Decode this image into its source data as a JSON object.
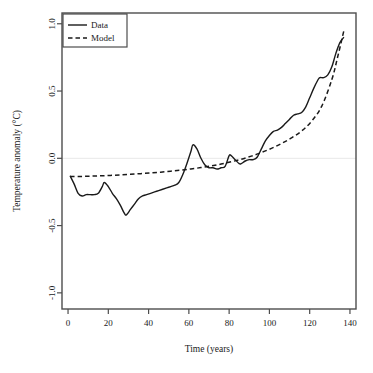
{
  "chart_data": {
    "type": "line",
    "title": "",
    "xlabel": "Time (years)",
    "ylabel": "Temperature anomaly (°C)",
    "xlim": [
      -3,
      143
    ],
    "ylim": [
      -1.12,
      1.08
    ],
    "xticks": [
      0,
      20,
      40,
      60,
      80,
      100,
      120,
      140
    ],
    "xticklabels": [
      "0",
      "20",
      "40",
      "60",
      "80",
      "100",
      "120",
      "140"
    ],
    "yticks": [
      -1.0,
      -0.5,
      0.0,
      0.5,
      1.0
    ],
    "yticklabels": [
      "-1.0",
      "-0.5",
      "0.0",
      "0.5",
      "1.0"
    ],
    "grid": false,
    "zero_line": true,
    "zero_line_color": "#e8e8e8",
    "frame": true,
    "frame_color": "#4d4d4d",
    "legend": {
      "position": "top-left",
      "entries": [
        {
          "label": "Data",
          "style": "solid",
          "color": "#1a1a1a"
        },
        {
          "label": "Model",
          "style": "dashed",
          "color": "#1a1a1a"
        }
      ]
    },
    "series": [
      {
        "name": "Data",
        "style": "solid",
        "color": "#1a1a1a",
        "x": [
          1,
          3,
          5,
          7,
          9,
          11,
          13,
          15,
          17,
          18,
          20,
          22,
          24,
          26,
          28,
          29,
          31,
          33,
          35,
          37,
          39,
          41,
          43,
          45,
          47,
          49,
          51,
          53,
          55,
          57,
          59,
          61,
          62,
          64,
          66,
          68,
          70,
          72,
          74,
          76,
          78,
          80,
          81,
          83,
          85,
          86,
          88,
          90,
          92,
          94,
          96,
          98,
          100,
          102,
          104,
          106,
          108,
          110,
          112,
          114,
          116,
          118,
          120,
          122,
          124,
          125,
          127,
          129,
          131,
          133,
          135,
          137
        ],
        "y": [
          -0.13,
          -0.19,
          -0.26,
          -0.28,
          -0.27,
          -0.27,
          -0.27,
          -0.26,
          -0.21,
          -0.18,
          -0.21,
          -0.26,
          -0.3,
          -0.35,
          -0.41,
          -0.42,
          -0.38,
          -0.34,
          -0.3,
          -0.28,
          -0.27,
          -0.26,
          -0.25,
          -0.24,
          -0.23,
          -0.22,
          -0.21,
          -0.2,
          -0.18,
          -0.12,
          -0.04,
          0.05,
          0.1,
          0.07,
          0.0,
          -0.05,
          -0.07,
          -0.07,
          -0.08,
          -0.07,
          -0.06,
          0.02,
          0.02,
          -0.01,
          -0.04,
          -0.04,
          -0.02,
          -0.01,
          -0.01,
          0.01,
          0.07,
          0.13,
          0.17,
          0.2,
          0.21,
          0.23,
          0.26,
          0.29,
          0.32,
          0.33,
          0.34,
          0.38,
          0.45,
          0.52,
          0.58,
          0.6,
          0.6,
          0.62,
          0.68,
          0.78,
          0.86,
          0.9
        ]
      },
      {
        "name": "Model",
        "style": "dashed",
        "color": "#1a1a1a",
        "x": [
          1,
          6,
          11,
          16,
          21,
          26,
          31,
          36,
          41,
          46,
          51,
          56,
          61,
          66,
          71,
          76,
          81,
          86,
          91,
          96,
          101,
          106,
          111,
          116,
          121,
          126,
          131,
          134,
          137
        ],
        "y": [
          -0.135,
          -0.135,
          -0.133,
          -0.13,
          -0.127,
          -0.123,
          -0.119,
          -0.114,
          -0.109,
          -0.103,
          -0.096,
          -0.088,
          -0.079,
          -0.069,
          -0.057,
          -0.043,
          -0.026,
          -0.007,
          0.016,
          0.043,
          0.074,
          0.11,
          0.152,
          0.203,
          0.277,
          0.388,
          0.585,
          0.76,
          0.95
        ]
      }
    ]
  }
}
